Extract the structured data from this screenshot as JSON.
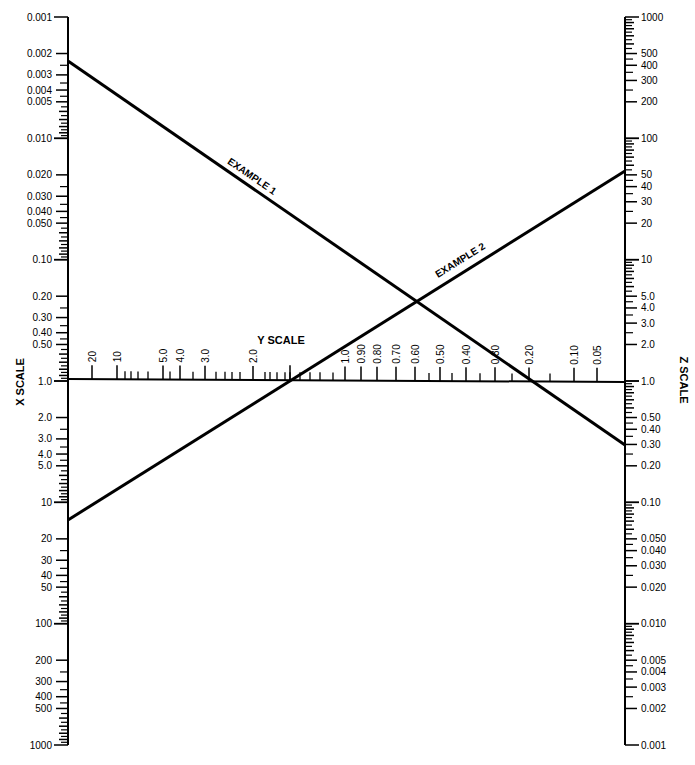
{
  "chart_data": {
    "type": "nomograph",
    "title": "",
    "scales": {
      "x": {
        "name": "X SCALE",
        "position": "left",
        "orientation": "vertical, increasing downward",
        "range": [
          0.001,
          1000
        ],
        "log": true,
        "labels": [
          "0.001",
          "0.002",
          "0.003",
          "0.004",
          "0.005",
          "0.010",
          "0.020",
          "0.030",
          "0.040",
          "0.050",
          "0.10",
          "0.20",
          "0.30",
          "0.40",
          "0.50",
          "1.0",
          "2.0",
          "3.0",
          "4.0",
          "5.0",
          "10",
          "20",
          "30",
          "40",
          "50",
          "100",
          "200",
          "300",
          "400",
          "500",
          "1000"
        ]
      },
      "y": {
        "name": "Y SCALE",
        "position": "middle",
        "orientation": "horizontal, decreasing rightward",
        "labels": [
          "20",
          "10",
          "5.0",
          "4.0",
          "3.0",
          "2.0",
          "1.0",
          "0.90",
          "0.80",
          "0.70",
          "0.60",
          "0.50",
          "0.40",
          "0.30",
          "0.20",
          "0.10",
          "0.05"
        ]
      },
      "z": {
        "name": "Z SCALE",
        "position": "right",
        "orientation": "vertical, decreasing downward",
        "range": [
          1000,
          0.001
        ],
        "log": true,
        "labels": [
          "1000",
          "500",
          "400",
          "300",
          "200",
          "100",
          "50",
          "40",
          "30",
          "20",
          "10",
          "5.0",
          "4.0",
          "3.0",
          "2.0",
          "1.0",
          "0.50",
          "0.40",
          "0.30",
          "0.20",
          "0.10",
          "0.050",
          "0.040",
          "0.030",
          "0.020",
          "0.010",
          "0.005",
          "0.004",
          "0.003",
          "0.002",
          "0.001"
        ]
      }
    },
    "examples": [
      {
        "name": "EXAMPLE 1",
        "x_value": 0.0025,
        "y_value": 0.2,
        "z_value": 0.3
      },
      {
        "name": "EXAMPLE 2",
        "x_value": 15,
        "y_value": 1.5,
        "z_value": 60
      }
    ]
  },
  "labels": {
    "x_scale": "X SCALE",
    "y_scale": "Y SCALE",
    "z_scale": "Z SCALE",
    "example1": "EXAMPLE 1",
    "example2": "EXAMPLE 2"
  }
}
